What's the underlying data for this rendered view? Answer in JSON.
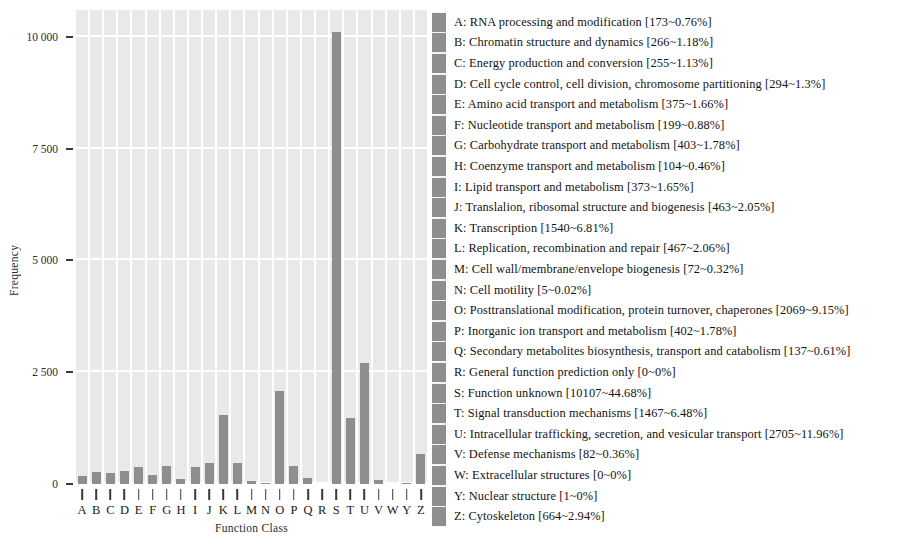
{
  "chart_data": {
    "type": "bar",
    "title": "",
    "xlabel": "Function Class",
    "ylabel": "Frequency",
    "ylim": [
      0,
      10600
    ],
    "grid": true,
    "legend_position": "right",
    "bar_color": "#8e8e8e",
    "plot_background": "#e9e9e9",
    "gridline_color": "#ffffff",
    "categories": [
      "A",
      "B",
      "C",
      "D",
      "E",
      "F",
      "G",
      "H",
      "I",
      "J",
      "K",
      "L",
      "M",
      "N",
      "O",
      "P",
      "Q",
      "R",
      "S",
      "T",
      "U",
      "V",
      "W",
      "Y",
      "Z"
    ],
    "values": [
      173,
      266,
      255,
      294,
      375,
      199,
      403,
      104,
      373,
      463,
      1540,
      467,
      72,
      5,
      2069,
      402,
      137,
      0,
      10107,
      1467,
      2705,
      82,
      0,
      1,
      664
    ],
    "y_tick_labels": [
      "0",
      "2 500",
      "5 000",
      "7 500",
      "10 000"
    ],
    "y_tick_values": [
      0,
      2500,
      5000,
      7500,
      10000
    ],
    "x_tick_labels": [
      "A",
      "B",
      "C",
      "D",
      "E",
      "F",
      "G",
      "H",
      "I",
      "J",
      "K",
      "L",
      "M",
      "N",
      "O",
      "P",
      "Q",
      "R",
      "S",
      "T",
      "U",
      "V",
      "W",
      "Y",
      "Z"
    ]
  },
  "legend": {
    "entries": [
      {
        "key": "A",
        "label": "RNA processing and modification",
        "count": 173,
        "percent": "0.76%",
        "text": "A: RNA processing and modification [173~0.76%]"
      },
      {
        "key": "B",
        "label": "Chromatin structure and dynamics",
        "count": 266,
        "percent": "1.18%",
        "text": "B: Chromatin structure and dynamics [266~1.18%]"
      },
      {
        "key": "C",
        "label": "Energy production and conversion",
        "count": 255,
        "percent": "1.13%",
        "text": "C: Energy production and conversion [255~1.13%]"
      },
      {
        "key": "D",
        "label": "Cell cycle control, cell division, chromosome partitioning",
        "count": 294,
        "percent": "1.3%",
        "text": "D: Cell cycle control, cell division, chromosome partitioning [294~1.3%]"
      },
      {
        "key": "E",
        "label": "Amino acid transport and metabolism",
        "count": 375,
        "percent": "1.66%",
        "text": "E: Amino acid transport and metabolism [375~1.66%]"
      },
      {
        "key": "F",
        "label": "Nucleotide transport and metabolism",
        "count": 199,
        "percent": "0.88%",
        "text": "F: Nucleotide transport and metabolism [199~0.88%]"
      },
      {
        "key": "G",
        "label": "Carbohydrate transport and metabolism",
        "count": 403,
        "percent": "1.78%",
        "text": "G: Carbohydrate transport and metabolism [403~1.78%]"
      },
      {
        "key": "H",
        "label": "Coenzyme transport and metabolism",
        "count": 104,
        "percent": "0.46%",
        "text": "H: Coenzyme transport and metabolism [104~0.46%]"
      },
      {
        "key": "I",
        "label": "Lipid transport and metabolism",
        "count": 373,
        "percent": "1.65%",
        "text": "I: Lipid transport and metabolism [373~1.65%]"
      },
      {
        "key": "J",
        "label": "Translalion, ribosomal structure and biogenesis",
        "count": 463,
        "percent": "2.05%",
        "text": "J: Translalion, ribosomal structure and biogenesis [463~2.05%]"
      },
      {
        "key": "K",
        "label": "Transcription",
        "count": 1540,
        "percent": "6.81%",
        "text": "K: Transcription [1540~6.81%]"
      },
      {
        "key": "L",
        "label": "Replication, recombination and repair",
        "count": 467,
        "percent": "2.06%",
        "text": "L: Replication, recombination and repair [467~2.06%]"
      },
      {
        "key": "M",
        "label": "Cell wall/membrane/envelope biogenesis",
        "count": 72,
        "percent": "0.32%",
        "text": "M: Cell wall/membrane/envelope biogenesis [72~0.32%]"
      },
      {
        "key": "N",
        "label": "Cell motility",
        "count": 5,
        "percent": "0.02%",
        "text": "N: Cell motility [5~0.02%]"
      },
      {
        "key": "O",
        "label": "Posttranslational modification, protein turnover, chaperones",
        "count": 2069,
        "percent": "9.15%",
        "text": "O: Posttranslational modification, protein turnover, chaperones [2069~9.15%]"
      },
      {
        "key": "P",
        "label": "Inorganic ion transport and metabolism",
        "count": 402,
        "percent": "1.78%",
        "text": "P: Inorganic ion transport and metabolism [402~1.78%]"
      },
      {
        "key": "Q",
        "label": "Secondary metabolites biosynthesis, transport and catabolism",
        "count": 137,
        "percent": "0.61%",
        "text": "Q: Secondary metabolites biosynthesis, transport and catabolism [137~0.61%]"
      },
      {
        "key": "R",
        "label": "General function prediction only",
        "count": 0,
        "percent": "0%",
        "text": "R: General function prediction only [0~0%]"
      },
      {
        "key": "S",
        "label": "Function unknown",
        "count": 10107,
        "percent": "44.68%",
        "text": "S: Function unknown [10107~44.68%]"
      },
      {
        "key": "T",
        "label": "Signal transduction mechanisms",
        "count": 1467,
        "percent": "6.48%",
        "text": "T: Signal transduction mechanisms [1467~6.48%]"
      },
      {
        "key": "U",
        "label": "Intracellular trafficking, secretion, and vesicular transport",
        "count": 2705,
        "percent": "11.96%",
        "text": "U: Intracellular trafficking, secretion, and vesicular transport [2705~11.96%]"
      },
      {
        "key": "V",
        "label": "Defense mechanisms",
        "count": 82,
        "percent": "0.36%",
        "text": "V: Defense mechanisms [82~0.36%]"
      },
      {
        "key": "W",
        "label": "Extracellular structures",
        "count": 0,
        "percent": "0%",
        "text": "W: Extracellular structures [0~0%]"
      },
      {
        "key": "Y",
        "label": "Nuclear structure",
        "count": 1,
        "percent": "0%",
        "text": "Y: Nuclear structure [1~0%]"
      },
      {
        "key": "Z",
        "label": "Cytoskeleton",
        "count": 664,
        "percent": "2.94%",
        "text": "Z: Cytoskeleton [664~2.94%]"
      }
    ]
  }
}
